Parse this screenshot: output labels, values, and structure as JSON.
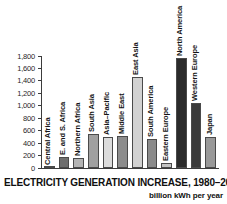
{
  "chart_data": {
    "type": "bar",
    "title": "ELECTRICITY GENERATION  INCREASE, 1980–2001",
    "subtitle": "billion kWh per year",
    "xlabel": "",
    "ylabel": "",
    "ylim": [
      0,
      1800
    ],
    "grid": false,
    "legend": "none",
    "ytick_labels": [
      "1,800",
      "1,600",
      "1,400",
      "1,200",
      "1,000",
      "800",
      "600",
      "400",
      "200",
      "0"
    ],
    "ytick_values": [
      1800,
      1600,
      1400,
      1200,
      1000,
      800,
      600,
      400,
      200,
      0
    ],
    "categories": [
      "Central Africa",
      "E. and S. Africa",
      "Northern Africa",
      "South Asia",
      "Asia–Pacific",
      "Middle East",
      "East Asia",
      "South America",
      "Eastern Europe",
      "North America",
      "Western Europe",
      "Japan"
    ],
    "values": [
      10,
      180,
      155,
      540,
      505,
      520,
      1460,
      470,
      85,
      1770,
      1040,
      500
    ],
    "bar_colors": [
      "#a8a8a8",
      "#6e6e6e",
      "#b4b4b4",
      "#a0a0a0",
      "#dcdcdc",
      "#8c8c8c",
      "#d2d2d2",
      "#8a8a8a",
      "#c4c4c4",
      "#2b2b2b",
      "#3a3a3a",
      "#999999"
    ]
  },
  "colors": {
    "axis": "#3c3c3c",
    "text": "#141414",
    "background": "#ffffff"
  }
}
